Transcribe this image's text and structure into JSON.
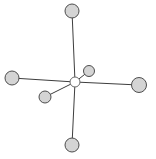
{
  "diagram": {
    "type": "ball-and-stick-octahedral-model",
    "canvas": {
      "width": 156,
      "height": 159,
      "background": "#ffffff"
    },
    "colors": {
      "bond": "#3d3d3d",
      "atom_fill": "#d4d4d4",
      "atom_stroke": "#4d4d4d",
      "center_fill": "#ffffff",
      "center_stroke": "#6a6a6a"
    },
    "bond_width": 1,
    "atom_stroke_width": 1,
    "center_node": {
      "id": "central-atom",
      "x": 75,
      "y": 82,
      "r": 5
    },
    "nodes": [
      {
        "id": "atom-top",
        "x": 72,
        "y": 11,
        "r": 7
      },
      {
        "id": "atom-bottom",
        "x": 72,
        "y": 145,
        "r": 7
      },
      {
        "id": "atom-left",
        "x": 12,
        "y": 78,
        "r": 7
      },
      {
        "id": "atom-right",
        "x": 139,
        "y": 85,
        "r": 7.5
      },
      {
        "id": "atom-back-upper-right",
        "x": 89,
        "y": 71,
        "r": 5.5
      },
      {
        "id": "atom-front-lower-left",
        "x": 45,
        "y": 97,
        "r": 6
      }
    ],
    "bonds": [
      {
        "from": "central-atom",
        "to": "atom-top"
      },
      {
        "from": "central-atom",
        "to": "atom-bottom"
      },
      {
        "from": "central-atom",
        "to": "atom-left"
      },
      {
        "from": "central-atom",
        "to": "atom-right"
      },
      {
        "from": "central-atom",
        "to": "atom-back-upper-right"
      },
      {
        "from": "central-atom",
        "to": "atom-front-lower-left"
      }
    ]
  }
}
